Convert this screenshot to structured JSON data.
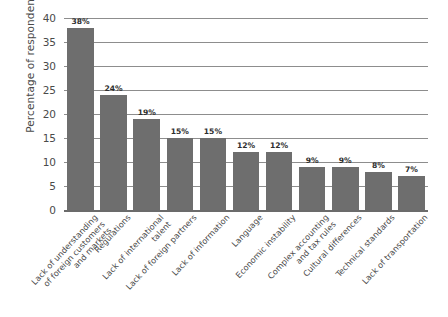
{
  "chart_data": {
    "type": "bar",
    "title": "",
    "subtitle": "",
    "xlabel": "",
    "ylabel": "Percentage of respondents",
    "ylim": [
      0,
      40
    ],
    "ytick_step": 5,
    "yticks": [
      "40",
      "35",
      "30",
      "25",
      "20",
      "15",
      "10",
      "5",
      "0"
    ],
    "grid": "horizontal",
    "legend": "none",
    "orientation": "vertical",
    "value_label_suffix": "%",
    "bar_color": "#6e6e6e",
    "gridline_color": "#8d8d8d",
    "axis_color": "#6b6b6b",
    "text_color": "#4a4a4a",
    "categories": [
      "Lack of understanding\nof foreign customers\nand markets",
      "Regulations",
      "Lack of international\ntalent",
      "Lack of foreign partners",
      "Lack of information",
      "Language",
      "Economic instability",
      "Complex accounting\nand tax rules",
      "Cultural differences",
      "Technical standards",
      "Lack of transportation"
    ],
    "values": [
      38,
      24,
      19,
      15,
      15,
      12,
      12,
      9,
      9,
      8,
      7
    ],
    "data_labels": [
      "38%",
      "24%",
      "19%",
      "15%",
      "15%",
      "12%",
      "12%",
      "9%",
      "9%",
      "8%",
      "7%"
    ]
  }
}
